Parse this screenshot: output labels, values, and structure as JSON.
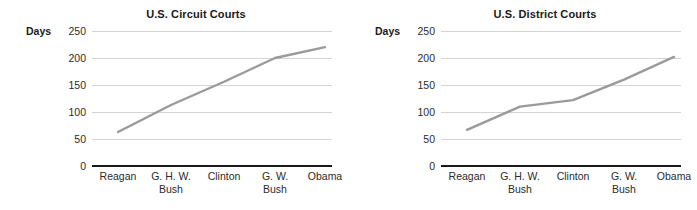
{
  "figure": {
    "background_color": "#ffffff",
    "line_color": "#9a9a9a",
    "gridline_color": "#d4d4d4",
    "axis_color": "#1a1a1a"
  },
  "panels": [
    {
      "key": "circuit",
      "title": "U.S. Circuit Courts",
      "axis_unit_label": "Days"
    },
    {
      "key": "district",
      "title": "U.S. District Courts",
      "axis_unit_label": "Days"
    }
  ],
  "yticks": [
    "250",
    "200",
    "150",
    "100",
    "50",
    "0"
  ],
  "xticks": [
    {
      "line1": "Reagan",
      "line2": ""
    },
    {
      "line1": "G. H. W.",
      "line2": "Bush"
    },
    {
      "line1": "Clinton",
      "line2": ""
    },
    {
      "line1": "G. W.",
      "line2": "Bush"
    },
    {
      "line1": "Obama",
      "line2": ""
    }
  ],
  "chart_data": [
    {
      "type": "line",
      "title": "U.S. Circuit Courts",
      "xlabel": "",
      "ylabel": "Days",
      "categories": [
        "Reagan",
        "G. H. W. Bush",
        "Clinton",
        "G. W. Bush",
        "Obama"
      ],
      "values": [
        63,
        113,
        156,
        200,
        220
      ],
      "ylim": [
        0,
        250
      ],
      "ytick_values": [
        0,
        50,
        100,
        150,
        200,
        250
      ],
      "grid": true,
      "legend": false,
      "series_color": "#9a9a9a"
    },
    {
      "type": "line",
      "title": "U.S. District Courts",
      "xlabel": "",
      "ylabel": "Days",
      "categories": [
        "Reagan",
        "G. H. W. Bush",
        "Clinton",
        "G. W. Bush",
        "Obama"
      ],
      "values": [
        67,
        110,
        122,
        160,
        202
      ],
      "ylim": [
        0,
        250
      ],
      "ytick_values": [
        0,
        50,
        100,
        150,
        200,
        250
      ],
      "grid": true,
      "legend": false,
      "series_color": "#9a9a9a"
    }
  ]
}
